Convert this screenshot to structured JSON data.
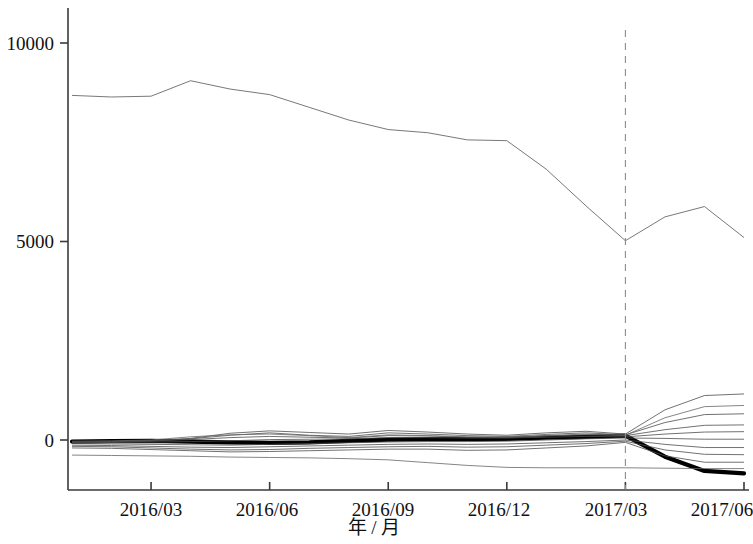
{
  "chart_data": {
    "type": "line",
    "title": "",
    "subtitle": "",
    "xlabel": "年 / 月",
    "ylabel": "",
    "grid": false,
    "legend": "none",
    "xlim": [
      0,
      18
    ],
    "ylim": [
      -1500,
      11000
    ],
    "y_ticks": [
      0,
      5000,
      10000
    ],
    "y_tick_labels": [
      "0",
      "5000",
      "10000"
    ],
    "x_ticks": [
      2,
      5,
      8,
      11,
      14,
      17
    ],
    "x_tick_labels": [
      "2016/03",
      "2016/06",
      "2016/09",
      "2016/12",
      "2017/03",
      "2017/06"
    ],
    "x_categories": [
      "2016/01",
      "2016/02",
      "2016/03",
      "2016/04",
      "2016/05",
      "2016/06",
      "2016/07",
      "2016/08",
      "2016/09",
      "2016/10",
      "2016/11",
      "2016/12",
      "2017/01",
      "2017/02",
      "2017/03",
      "2017/04",
      "2017/05",
      "2017/06"
    ],
    "annotations": [
      {
        "name": "forecast-divider",
        "type": "vertical-dashed-line",
        "x": 14,
        "x_label": "2017/03",
        "style": "dashed",
        "color": "#8c8c8c"
      }
    ],
    "series": [
      {
        "name": "total-upper-series",
        "emphasis": "thin",
        "color": "#555555",
        "width": 0.8,
        "values": [
          8680,
          8640,
          8660,
          9050,
          8840,
          8700,
          8380,
          8060,
          7820,
          7740,
          7560,
          7540,
          6820,
          5900,
          5020,
          5620,
          5880,
          5100
        ]
      },
      {
        "name": "bold-focus-series",
        "emphasis": "bold",
        "color": "#000000",
        "width": 4.2,
        "values": [
          -40,
          -30,
          -20,
          -40,
          -60,
          -70,
          -60,
          -20,
          10,
          20,
          20,
          30,
          60,
          80,
          110,
          -420,
          -780,
          -840
        ]
      },
      {
        "name": "fan-series-1",
        "emphasis": "thin",
        "color": "#4d4d4d",
        "width": 0.8,
        "values": [
          -60,
          -40,
          -10,
          40,
          170,
          230,
          190,
          150,
          240,
          200,
          150,
          120,
          180,
          220,
          150,
          760,
          1120,
          1160
        ]
      },
      {
        "name": "fan-series-2",
        "emphasis": "thin",
        "color": "#4d4d4d",
        "width": 0.8,
        "values": [
          -80,
          -60,
          -30,
          30,
          120,
          180,
          120,
          90,
          180,
          150,
          110,
          90,
          140,
          180,
          130,
          440,
          640,
          660
        ]
      },
      {
        "name": "fan-series-3",
        "emphasis": "thin",
        "color": "#4d4d4d",
        "width": 0.8,
        "values": [
          -50,
          -40,
          -20,
          10,
          60,
          90,
          70,
          50,
          110,
          100,
          70,
          60,
          100,
          130,
          110,
          260,
          370,
          380
        ]
      },
      {
        "name": "fan-series-4",
        "emphasis": "thin",
        "color": "#4d4d4d",
        "width": 0.8,
        "values": [
          -70,
          -60,
          -50,
          -40,
          -20,
          10,
          20,
          30,
          60,
          60,
          50,
          50,
          70,
          90,
          80,
          150,
          200,
          210
        ]
      },
      {
        "name": "fan-series-5",
        "emphasis": "thin",
        "color": "#4d4d4d",
        "width": 0.8,
        "values": [
          -90,
          -100,
          -110,
          -120,
          -130,
          -110,
          -90,
          -70,
          -50,
          -40,
          -40,
          -30,
          0,
          30,
          50,
          40,
          20,
          20
        ]
      },
      {
        "name": "fan-series-6",
        "emphasis": "thin",
        "color": "#4d4d4d",
        "width": 0.8,
        "values": [
          -130,
          -140,
          -160,
          -180,
          -190,
          -170,
          -150,
          -130,
          -110,
          -100,
          -110,
          -100,
          -70,
          -40,
          0,
          -110,
          -190,
          -190
        ]
      },
      {
        "name": "fan-series-7",
        "emphasis": "thin",
        "color": "#4d4d4d",
        "width": 0.8,
        "values": [
          -160,
          -170,
          -200,
          -230,
          -250,
          -240,
          -210,
          -190,
          -170,
          -160,
          -180,
          -170,
          -130,
          -90,
          -30,
          -250,
          -360,
          -370
        ]
      },
      {
        "name": "fan-series-8",
        "emphasis": "thin",
        "color": "#4d4d4d",
        "width": 0.8,
        "values": [
          -200,
          -210,
          -240,
          -270,
          -300,
          -290,
          -270,
          -250,
          -230,
          -230,
          -260,
          -250,
          -200,
          -150,
          -60,
          -400,
          -560,
          -560
        ]
      },
      {
        "name": "fan-series-9",
        "emphasis": "thin",
        "color": "#666666",
        "width": 0.8,
        "values": [
          -380,
          -390,
          -400,
          -410,
          -430,
          -440,
          -450,
          -470,
          -500,
          -570,
          -640,
          -690,
          -700,
          -700,
          -700,
          -710,
          -720,
          -720
        ]
      },
      {
        "name": "fan-series-10",
        "emphasis": "thin",
        "color": "#666666",
        "width": 0.8,
        "values": [
          -30,
          -20,
          0,
          80,
          130,
          150,
          110,
          60,
          130,
          110,
          80,
          70,
          110,
          150,
          120,
          560,
          840,
          870
        ]
      }
    ]
  },
  "axis": {
    "y_label_0": "0",
    "y_label_5000": "5000",
    "y_label_10000": "10000",
    "x_label_1": "2016/03",
    "x_label_2": "2016/06",
    "x_label_3": "2016/09",
    "x_label_4": "2016/12",
    "x_label_5": "2017/03",
    "x_label_6": "2017/06",
    "x_title": "年 / 月"
  },
  "colors": {
    "axis": "#3a3a3a",
    "bold_line": "#000000",
    "thin_line": "#4d4d4d",
    "divider": "#8c8c8c",
    "background": "#ffffff"
  }
}
